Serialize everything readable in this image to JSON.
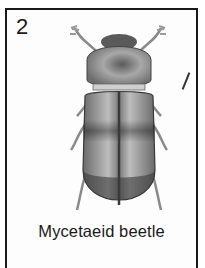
{
  "card": {
    "number": "2",
    "caption": "Mycetaeid beetle",
    "illustration": {
      "subject": "beetle-illustration",
      "description": "Grayscale drawing of a beetle viewed from above, with banded elytra"
    }
  },
  "colors": {
    "border": "#1a1a1a",
    "text": "#1a1a1a",
    "background": "#ffffff",
    "beetle_dark": "#3a3a3a",
    "beetle_mid": "#8a8a8a",
    "beetle_light": "#cfcfcf"
  }
}
